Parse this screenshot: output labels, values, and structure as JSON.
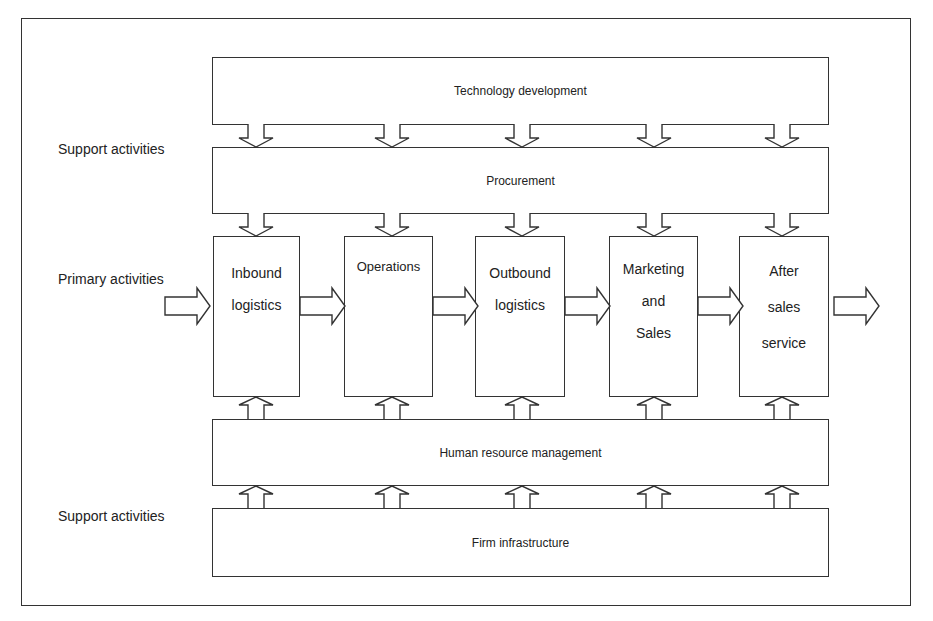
{
  "labels": {
    "support_top": "Support activities",
    "primary": "Primary activities",
    "support_bottom": "Support activities"
  },
  "support_activities": {
    "technology": "Technology development",
    "procurement": "Procurement",
    "hr": "Human resource management",
    "infrastructure": "Firm infrastructure"
  },
  "primary_activities": [
    {
      "line1": "Inbound",
      "line2": "logistics",
      "line3": ""
    },
    {
      "line1": "Operations",
      "line2": "",
      "line3": ""
    },
    {
      "line1": "Outbound",
      "line2": "logistics",
      "line3": ""
    },
    {
      "line1": "Marketing",
      "line2": "and",
      "line3": "Sales"
    },
    {
      "line1": "After",
      "line2": "sales",
      "line3": "service"
    }
  ]
}
